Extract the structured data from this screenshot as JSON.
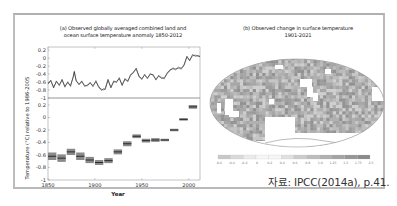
{
  "panel_a": {
    "title_line1": "(a) Observed globally averaged combined land and",
    "title_line2": "ocean surface temperature anomaly 1850-2012",
    "ylabel": "Temperature (°C) relative to 1986-2005",
    "xlabel": "Year"
  },
  "panel_b": {
    "title_line1": "(b) Observed change in surface temperature",
    "title_line2": "1901-2021"
  },
  "source": "자료: IPCC(2014a), p.41.",
  "chart_data": [
    {
      "type": "line",
      "title": "(a) Observed globally averaged combined land and ocean surface temperature anomaly 1850-2012",
      "xlabel": "",
      "ylabel": "Temperature (°C) relative to 1986-2005",
      "xlim": [
        1850,
        2012
      ],
      "ylim": [
        -1,
        0.2
      ],
      "yticks": [
        "0.2",
        "0",
        "-0.2",
        "-0.4",
        "-0.6",
        "-0.8",
        "-1"
      ],
      "grid": false,
      "series": [
        {
          "name": "Annual average",
          "x": [
            1850,
            1853,
            1856,
            1859,
            1862,
            1865,
            1868,
            1871,
            1874,
            1877,
            1878,
            1880,
            1883,
            1886,
            1889,
            1892,
            1895,
            1898,
            1901,
            1904,
            1907,
            1909,
            1911,
            1914,
            1917,
            1920,
            1923,
            1926,
            1929,
            1932,
            1935,
            1938,
            1941,
            1944,
            1947,
            1950,
            1953,
            1956,
            1959,
            1962,
            1965,
            1968,
            1971,
            1974,
            1977,
            1980,
            1983,
            1986,
            1989,
            1992,
            1995,
            1998,
            2001,
            2004,
            2007,
            2010,
            2012
          ],
          "values": [
            -0.62,
            -0.58,
            -0.72,
            -0.6,
            -0.66,
            -0.56,
            -0.7,
            -0.62,
            -0.68,
            -0.48,
            -0.32,
            -0.58,
            -0.64,
            -0.6,
            -0.68,
            -0.7,
            -0.6,
            -0.72,
            -0.56,
            -0.74,
            -0.78,
            -0.8,
            -0.76,
            -0.56,
            -0.72,
            -0.6,
            -0.58,
            -0.52,
            -0.66,
            -0.54,
            -0.56,
            -0.44,
            -0.34,
            -0.28,
            -0.44,
            -0.54,
            -0.4,
            -0.52,
            -0.38,
            -0.44,
            -0.52,
            -0.46,
            -0.48,
            -0.52,
            -0.36,
            -0.32,
            -0.24,
            -0.3,
            -0.22,
            -0.28,
            -0.16,
            0.02,
            -0.04,
            0.06,
            0.08,
            0.04,
            0.06
          ]
        }
      ]
    },
    {
      "type": "bar",
      "title": "Decadal averages",
      "xlabel": "Year",
      "ylabel": "Temperature (°C) relative to 1986-2005",
      "xlim": [
        1850,
        2012
      ],
      "ylim": [
        -1,
        0.2
      ],
      "xticks": [
        "1850",
        "1900",
        "1950",
        "2000"
      ],
      "yticks": [
        "0.2",
        "0",
        "-0.2",
        "-0.4",
        "-0.6",
        "-0.8",
        "-1"
      ],
      "grid": false,
      "series": [
        {
          "name": "Decadal mean",
          "decades": [
            1850,
            1860,
            1870,
            1880,
            1890,
            1900,
            1910,
            1920,
            1930,
            1940,
            1950,
            1960,
            1970,
            1980,
            1990,
            2000
          ],
          "values": [
            -0.62,
            -0.65,
            -0.55,
            -0.62,
            -0.68,
            -0.72,
            -0.69,
            -0.55,
            -0.42,
            -0.3,
            -0.37,
            -0.36,
            -0.36,
            -0.2,
            -0.03,
            0.17
          ],
          "uncertainty": [
            0.06,
            0.06,
            0.05,
            0.06,
            0.05,
            0.04,
            0.04,
            0.04,
            0.04,
            0.03,
            0.03,
            0.03,
            0.02,
            0.02,
            0.02,
            0.03
          ]
        }
      ]
    },
    {
      "type": "heatmap",
      "title": "(b) Observed change in surface temperature 1901-2021",
      "colorbar_ticks": [
        "-0.6",
        "-0.4",
        "-0.2",
        "0",
        "0.2",
        "0.4",
        "0.6",
        "0.8",
        "1.0",
        "1.25",
        "1.5",
        "1.75",
        "2.5"
      ],
      "colorbar_unit": "°C",
      "projection": "Robinson world map",
      "legend_position": "bottom"
    }
  ]
}
